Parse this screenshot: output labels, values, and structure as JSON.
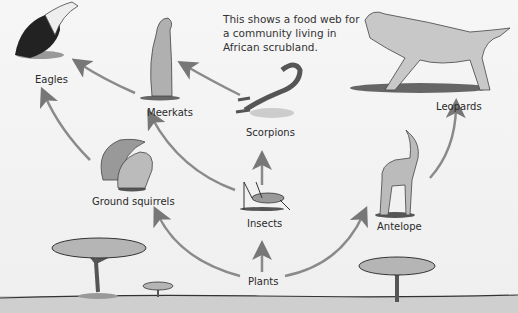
{
  "intro_text": "This shows a food web for a community living in African scrubland.",
  "organisms": {
    "eagles": "Eagles",
    "meerkats": "Meerkats",
    "scorpions": "Scorpions",
    "leopards": "Leopards",
    "ground_squirrels": "Ground squirrels",
    "insects": "Insects",
    "antelope": "Antelope",
    "plants": "Plants"
  },
  "links": [
    {
      "from": "Plants",
      "to": "Ground squirrels"
    },
    {
      "from": "Plants",
      "to": "Insects"
    },
    {
      "from": "Plants",
      "to": "Antelope"
    },
    {
      "from": "Insects",
      "to": "Scorpions"
    },
    {
      "from": "Insects",
      "to": "Meerkats"
    },
    {
      "from": "Scorpions",
      "to": "Meerkats"
    },
    {
      "from": "Meerkats",
      "to": "Eagles"
    },
    {
      "from": "Ground squirrels",
      "to": "Eagles"
    },
    {
      "from": "Ground squirrels",
      "to": "Meerkats"
    },
    {
      "from": "Antelope",
      "to": "Leopards"
    }
  ]
}
